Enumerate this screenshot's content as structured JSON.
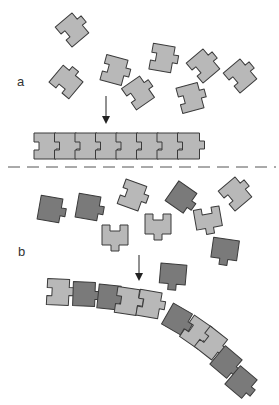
{
  "figure": {
    "panel_a_label": "a",
    "panel_b_label": "b"
  },
  "colors": {
    "light_piece": "#b8b8b8",
    "dark_piece": "#7a7a7a",
    "outline": "#3a3a3a",
    "divider": "#555555",
    "arrow": "#222222"
  },
  "panel_a": {
    "description": "Randomly oriented identical interlocking subunits assemble into a straight linear chain",
    "scattered_pieces": [
      {
        "x": 72,
        "y": 30,
        "rot": -40
      },
      {
        "x": 66,
        "y": 82,
        "rot": -50
      },
      {
        "x": 114,
        "y": 70,
        "rot": 15
      },
      {
        "x": 138,
        "y": 93,
        "rot": -35
      },
      {
        "x": 162,
        "y": 58,
        "rot": 10
      },
      {
        "x": 190,
        "y": 98,
        "rot": -15
      },
      {
        "x": 203,
        "y": 66,
        "rot": -40
      },
      {
        "x": 240,
        "y": 76,
        "rot": -40
      }
    ],
    "chain_count": 8,
    "chain_start_x": 34,
    "chain_y": 133
  },
  "panel_b": {
    "description": "Two subunit types (light and dark) assemble into a curved chain",
    "scattered_pieces": [
      {
        "x": 50,
        "y": 209,
        "rot": 10,
        "type": "dark"
      },
      {
        "x": 88,
        "y": 207,
        "rot": 10,
        "type": "dark"
      },
      {
        "x": 132,
        "y": 195,
        "rot": 20,
        "type": "light"
      },
      {
        "x": 181,
        "y": 197,
        "rot": 35,
        "type": "dark"
      },
      {
        "x": 235,
        "y": 194,
        "rot": -40,
        "type": "light"
      },
      {
        "x": 115,
        "y": 236,
        "rot": 0,
        "type": "light-u"
      },
      {
        "x": 158,
        "y": 225,
        "rot": 0,
        "type": "light-u"
      },
      {
        "x": 208,
        "y": 219,
        "rot": -10,
        "type": "light-u"
      },
      {
        "x": 225,
        "y": 250,
        "rot": 8,
        "type": "dark-down"
      },
      {
        "x": 173,
        "y": 275,
        "rot": 5,
        "type": "dark-down"
      }
    ],
    "chain": [
      {
        "x": 58,
        "y": 292,
        "rot": 3,
        "type": "light"
      },
      {
        "x": 84,
        "y": 294,
        "rot": 2,
        "type": "dark"
      },
      {
        "x": 109,
        "y": 297,
        "rot": 6,
        "type": "dark"
      },
      {
        "x": 127,
        "y": 301,
        "rot": 8,
        "type": "light"
      },
      {
        "x": 149,
        "y": 304,
        "rot": 10,
        "type": "light"
      },
      {
        "x": 177,
        "y": 319,
        "rot": 30,
        "type": "dark"
      },
      {
        "x": 196,
        "y": 332,
        "rot": 35,
        "type": "light"
      },
      {
        "x": 211,
        "y": 343,
        "rot": 38,
        "type": "light"
      },
      {
        "x": 226,
        "y": 362,
        "rot": 40,
        "type": "dark"
      },
      {
        "x": 241,
        "y": 382,
        "rot": 40,
        "type": "dark"
      }
    ]
  }
}
